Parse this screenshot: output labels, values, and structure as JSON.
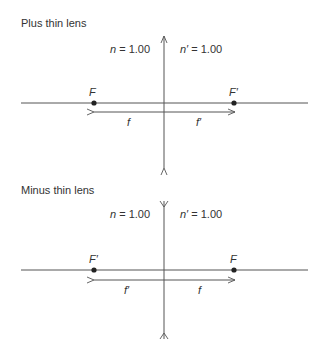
{
  "diagrams": [
    {
      "title": "Plus thin lens",
      "n_label_var": "n",
      "n_label_val": " = 1.00",
      "n_prime_label_var": "n′",
      "n_prime_label_val": " = 1.00",
      "left_focal_point": "F",
      "right_focal_point": "F′",
      "left_distance": "f",
      "right_distance": "f′",
      "lens_type": "converging"
    },
    {
      "title": "Minus thin lens",
      "n_label_var": "n",
      "n_label_val": " = 1.00",
      "n_prime_label_var": "n′",
      "n_prime_label_val": " = 1.00",
      "left_focal_point": "F′",
      "right_focal_point": "F",
      "left_distance": "f′",
      "right_distance": "f",
      "lens_type": "diverging"
    }
  ],
  "colors": {
    "line": "#555555",
    "dot": "#222222",
    "text": "#333333"
  }
}
